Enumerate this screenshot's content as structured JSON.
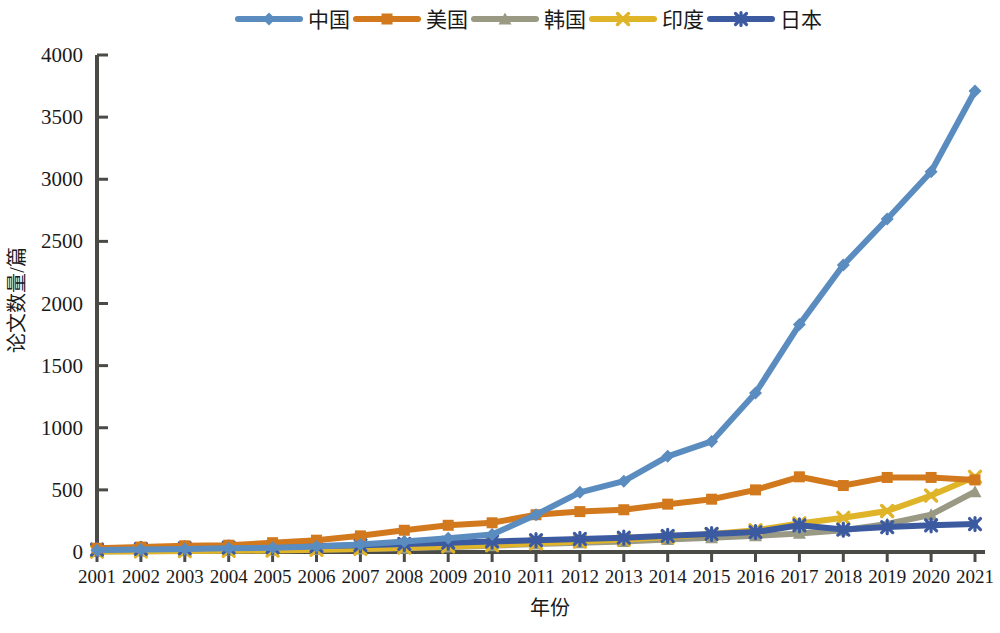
{
  "chart_data": {
    "type": "line",
    "title": "",
    "xlabel": "年份",
    "ylabel": "论文数量/篇",
    "categories": [
      "2001",
      "2002",
      "2003",
      "2004",
      "2005",
      "2006",
      "2007",
      "2008",
      "2009",
      "2010",
      "2011",
      "2012",
      "2013",
      "2014",
      "2015",
      "2016",
      "2017",
      "2018",
      "2019",
      "2020",
      "2021"
    ],
    "x": [
      2001,
      2002,
      2003,
      2004,
      2005,
      2006,
      2007,
      2008,
      2009,
      2010,
      2011,
      2012,
      2013,
      2014,
      2015,
      2016,
      2017,
      2018,
      2019,
      2020,
      2021
    ],
    "ylim": [
      0,
      4000
    ],
    "xlim": [
      2001,
      2021
    ],
    "yticks": [
      0,
      500,
      1000,
      1500,
      2000,
      2500,
      3000,
      3500,
      4000
    ],
    "ytick_labels": [
      "0",
      "500",
      "1000",
      "1500",
      "2000",
      "2500",
      "3000",
      "3500",
      "4000"
    ],
    "grid": false,
    "legend_position": "top",
    "series": [
      {
        "name": "中国",
        "color": "#5b8cc0",
        "marker": "diamond",
        "values": [
          15,
          20,
          25,
          30,
          35,
          45,
          60,
          85,
          110,
          140,
          300,
          480,
          570,
          770,
          890,
          1280,
          1830,
          2310,
          2680,
          3060,
          3710
        ]
      },
      {
        "name": "美国",
        "color": "#d2791e",
        "marker": "square",
        "values": [
          30,
          40,
          50,
          55,
          75,
          95,
          130,
          175,
          215,
          235,
          300,
          325,
          340,
          385,
          425,
          500,
          605,
          535,
          600,
          600,
          580
        ]
      },
      {
        "name": "韩国",
        "color": "#9a9a84",
        "marker": "triangle",
        "values": [
          5,
          8,
          10,
          12,
          15,
          20,
          25,
          30,
          40,
          50,
          65,
          75,
          85,
          100,
          115,
          130,
          150,
          175,
          225,
          300,
          485
        ]
      },
      {
        "name": "印度",
        "color": "#e0b429",
        "marker": "x",
        "values": [
          3,
          5,
          7,
          10,
          12,
          18,
          25,
          35,
          45,
          55,
          70,
          85,
          100,
          120,
          145,
          175,
          230,
          275,
          330,
          455,
          605
        ]
      },
      {
        "name": "日本",
        "color": "#3c5aa0",
        "marker": "asterisk",
        "values": [
          20,
          25,
          30,
          35,
          40,
          48,
          55,
          65,
          75,
          85,
          95,
          105,
          115,
          130,
          145,
          160,
          215,
          180,
          200,
          215,
          225
        ]
      }
    ]
  }
}
